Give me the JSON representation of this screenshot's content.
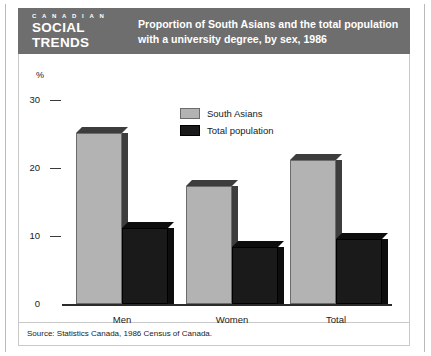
{
  "banner": {
    "logo_line1": "C A N A D I A N",
    "logo_line2": "SOCIAL",
    "logo_line3": "TRENDS",
    "title_line1": "Proportion of South Asians and the total population",
    "title_line2": "with a university degree, by sex, 1986",
    "background_color": "#6e6e6e",
    "text_color": "#ffffff"
  },
  "footer": {
    "source": "Source: Statistics Canada, 1986 Census of Canada."
  },
  "chart_data": {
    "type": "bar",
    "title": "Proportion of South Asians and the total population with a university degree, by sex, 1986",
    "xlabel": "",
    "ylabel": "%",
    "unit_symbol": "%",
    "categories": [
      "Men",
      "Women",
      "Total"
    ],
    "series": [
      {
        "name": "South Asians",
        "color": "#b3b3b3",
        "values": [
          25.2,
          17.4,
          21.2
        ]
      },
      {
        "name": "Total population",
        "color": "#1a1a1a",
        "values": [
          11.2,
          8.4,
          9.6
        ]
      }
    ],
    "ylim": [
      0,
      30
    ],
    "yticks": [
      0,
      10,
      20,
      30
    ],
    "ytick_labels": [
      "0",
      "10",
      "20",
      "30"
    ],
    "grid": false,
    "legend_position": "top-center",
    "style": "3d-bars"
  }
}
